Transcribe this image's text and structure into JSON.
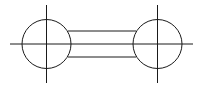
{
  "diagram": {
    "type": "line-drawing",
    "stroke_color": "#1a1a1a",
    "background_color": "#ffffff",
    "center_line": {
      "x1": 10,
      "y1": 44,
      "x2": 193,
      "y2": 44
    },
    "circles": [
      {
        "id": "left",
        "cx": 46.5,
        "cy": 44,
        "r": 24.5,
        "vertical_axis": {
          "x": 46.5,
          "y1": 5,
          "y2": 83
        }
      },
      {
        "id": "right",
        "cx": 157.5,
        "cy": 44,
        "r": 24.5,
        "vertical_axis": {
          "x": 157.5,
          "y1": 5,
          "y2": 83
        }
      }
    ],
    "rails": [
      {
        "id": "upper",
        "x1": 68,
        "y1": 31,
        "x2": 136,
        "y2": 31
      },
      {
        "id": "lower",
        "x1": 68,
        "y1": 57,
        "x2": 136,
        "y2": 57
      }
    ]
  }
}
